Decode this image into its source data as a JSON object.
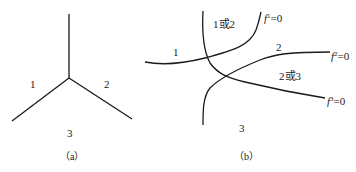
{
  "figure_a": {
    "regions": [
      "1",
      "2",
      "3"
    ],
    "caption": "（a）"
  },
  "figure_b": {
    "regions": {
      "r1": "1",
      "r1or2": "1或2",
      "r2": "2",
      "r2or3": "2或3",
      "r3": "3"
    },
    "curves": [
      {
        "name": "f",
        "sup": "1",
        "eq": "=0"
      },
      {
        "name": "f",
        "sup": "2",
        "eq": "=0"
      },
      {
        "name": "f",
        "sup": "3",
        "eq": "=0"
      }
    ],
    "caption": "（b）"
  },
  "colors": {
    "stroke": "#1a1a1a",
    "text": "#222222",
    "background": "#ffffff"
  }
}
